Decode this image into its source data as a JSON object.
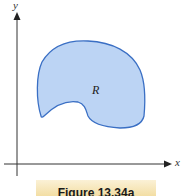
{
  "figure": {
    "caption": "Figure 13.34a",
    "region_label": "R",
    "axes": {
      "x_label": "x",
      "y_label": "y"
    },
    "colors": {
      "region_fill": "#bcd4f4",
      "region_stroke": "#3a6fc4",
      "axis": "#333333",
      "caption_bg": "#f6e5b4"
    }
  }
}
